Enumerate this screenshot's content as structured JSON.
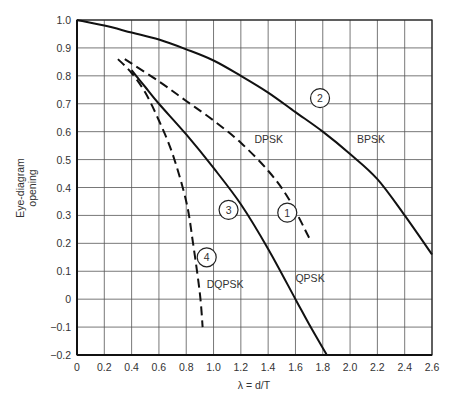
{
  "chart_data": {
    "type": "line",
    "title": "",
    "xlabel": "λ = d/T",
    "ylabel": "Eye-diagram opening",
    "xlim": [
      0,
      2.6
    ],
    "ylim": [
      -0.2,
      1.0
    ],
    "grid": true,
    "x_ticks": [
      "0",
      "0.2",
      "0.4",
      "0.6",
      "0.8",
      "1.0",
      "1.2",
      "1.4",
      "1.6",
      "1.8",
      "2.0",
      "2.2",
      "2.4",
      "2.6"
    ],
    "y_ticks": [
      "1.0",
      "0.9",
      "0.8",
      "0.7",
      "0.6",
      "0.5",
      "0.4",
      "0.3",
      "0.2",
      "0.1",
      "0",
      "−0.1",
      "−0.2"
    ],
    "series": [
      {
        "name": "BPSK",
        "marker_label": "2",
        "style": "solid",
        "x": [
          0,
          0.2,
          0.4,
          0.6,
          0.8,
          1.0,
          1.2,
          1.4,
          1.6,
          1.8,
          2.0,
          2.2,
          2.4,
          2.6
        ],
        "values": [
          1.0,
          0.98,
          0.955,
          0.93,
          0.895,
          0.855,
          0.8,
          0.74,
          0.67,
          0.6,
          0.52,
          0.43,
          0.3,
          0.16
        ]
      },
      {
        "name": "QPSK",
        "marker_label": "3",
        "style": "solid",
        "x": [
          0.4,
          0.5,
          0.6,
          0.8,
          1.0,
          1.2,
          1.4,
          1.6,
          1.7,
          1.83
        ],
        "values": [
          0.82,
          0.76,
          0.7,
          0.59,
          0.47,
          0.34,
          0.18,
          0.0,
          -0.09,
          -0.2
        ]
      },
      {
        "name": "DPSK",
        "marker_label": "1",
        "style": "dashed",
        "x": [
          0.35,
          0.6,
          0.8,
          1.0,
          1.2,
          1.4,
          1.55,
          1.7
        ],
        "values": [
          0.86,
          0.78,
          0.71,
          0.64,
          0.56,
          0.46,
          0.36,
          0.22
        ]
      },
      {
        "name": "DQPSK",
        "marker_label": "4",
        "style": "dashed",
        "x": [
          0.3,
          0.4,
          0.5,
          0.6,
          0.7,
          0.8,
          0.85,
          0.9,
          0.92
        ],
        "values": [
          0.86,
          0.81,
          0.74,
          0.64,
          0.52,
          0.35,
          0.2,
          0.02,
          -0.1
        ]
      }
    ],
    "annotations": [
      {
        "text": "DPSK",
        "x": 1.3,
        "y": 0.56
      },
      {
        "text": "BPSK",
        "x": 2.05,
        "y": 0.56
      },
      {
        "text": "QPSK",
        "x": 1.6,
        "y": 0.06
      },
      {
        "text": "DQPSK",
        "x": 0.95,
        "y": 0.04
      }
    ],
    "circled_markers": [
      {
        "text": "1",
        "x": 1.54,
        "y": 0.31
      },
      {
        "text": "2",
        "x": 1.78,
        "y": 0.72
      },
      {
        "text": "3",
        "x": 1.11,
        "y": 0.32
      },
      {
        "text": "4",
        "x": 0.95,
        "y": 0.15
      }
    ]
  }
}
